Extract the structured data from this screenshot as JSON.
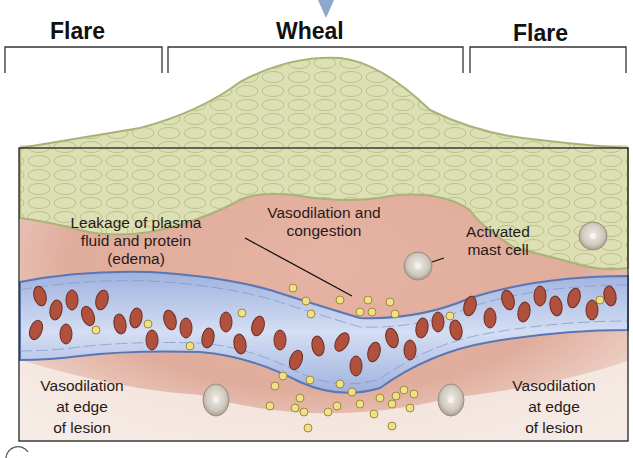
{
  "figure": {
    "headers": {
      "left": "Flare",
      "center": "Wheal",
      "right": "Flare"
    },
    "labels": {
      "edema": "Leakage of plasma fluid and protein (edema)",
      "edema_lines": [
        "Leakage of plasma",
        "fluid and protein",
        "(edema)"
      ],
      "congestion_lines": [
        "Vasodilation and",
        "congestion"
      ],
      "mast_cell_lines": [
        "Activated",
        "mast cell"
      ],
      "left_edge_lines": [
        "Vasodilation",
        "at edge",
        "of lesion"
      ],
      "right_edge_lines": [
        "Vasodilation",
        "at edge",
        "of lesion"
      ]
    },
    "colors": {
      "epidermis": "#dde0b4",
      "epidermis_outline": "#a9b276",
      "dermis": "#e2b2a2",
      "vessel": "#b9c6e6",
      "vessel_wall": "#5a76b4",
      "rbc": "#b0513e",
      "plasma_protein": "#f1e08a",
      "mast_cell": "#d6d0c6",
      "arrow": "#8fa6cf"
    }
  }
}
